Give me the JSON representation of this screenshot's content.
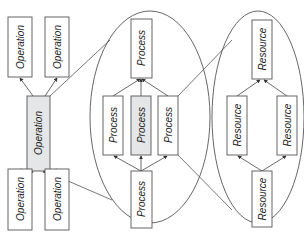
{
  "diagram": {
    "colors": {
      "stroke": "#555555",
      "box_fill": "#ffffff",
      "highlight_fill": "#e4e6e8",
      "text": "#222222"
    },
    "operation_group": {
      "nodes": [
        {
          "id": "op_tl",
          "label": "Operation",
          "highlighted": false
        },
        {
          "id": "op_tr",
          "label": "Operation",
          "highlighted": false
        },
        {
          "id": "op_center",
          "label": "Operation",
          "highlighted": true
        },
        {
          "id": "op_bl",
          "label": "Operation",
          "highlighted": false
        },
        {
          "id": "op_br",
          "label": "Operation",
          "highlighted": false
        }
      ]
    },
    "process_group": {
      "nodes": [
        {
          "id": "pr_top",
          "label": "Process",
          "highlighted": false
        },
        {
          "id": "pr_left",
          "label": "Process",
          "highlighted": false
        },
        {
          "id": "pr_mid",
          "label": "Process",
          "highlighted": true
        },
        {
          "id": "pr_right",
          "label": "Process",
          "highlighted": false
        },
        {
          "id": "pr_bottom",
          "label": "Process",
          "highlighted": false
        }
      ]
    },
    "resource_group": {
      "nodes": [
        {
          "id": "rs_top",
          "label": "Resource",
          "highlighted": false
        },
        {
          "id": "rs_left",
          "label": "Resource",
          "highlighted": false
        },
        {
          "id": "rs_right",
          "label": "Resource",
          "highlighted": false
        },
        {
          "id": "rs_bottom",
          "label": "Resource",
          "highlighted": false
        }
      ]
    },
    "edges": [
      {
        "from": "op_center",
        "to": "op_tl"
      },
      {
        "from": "op_center",
        "to": "op_tr"
      },
      {
        "from": "op_bl",
        "to": "op_center"
      },
      {
        "from": "op_br",
        "to": "op_center"
      },
      {
        "from": "pr_left",
        "to": "pr_top"
      },
      {
        "from": "pr_mid",
        "to": "pr_top"
      },
      {
        "from": "pr_right",
        "to": "pr_top"
      },
      {
        "from": "pr_bottom",
        "to": "pr_left"
      },
      {
        "from": "pr_bottom",
        "to": "pr_mid"
      },
      {
        "from": "pr_bottom",
        "to": "pr_right"
      },
      {
        "from": "rs_left",
        "to": "rs_top"
      },
      {
        "from": "rs_right",
        "to": "rs_top"
      },
      {
        "from": "rs_bottom",
        "to": "rs_left"
      },
      {
        "from": "rs_bottom",
        "to": "rs_right"
      }
    ],
    "mapping_lines": [
      {
        "from": "op_center",
        "to": "process_group",
        "description": "operation maps to process ellipse"
      },
      {
        "from": "pr_right",
        "to": "resource_group",
        "description": "process maps to resource ellipse"
      }
    ]
  }
}
